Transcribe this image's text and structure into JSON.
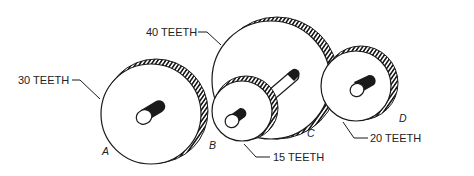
{
  "figure": {
    "type": "gear-train",
    "labels": {
      "gear_a_teeth": "30 TEETH",
      "gear_b_teeth": "15 TEETH",
      "gear_c_teeth": "40 TEETH",
      "gear_d_teeth": "20 TEETH"
    },
    "letters": {
      "a": "A",
      "b": "B",
      "c": "C",
      "d": "D"
    },
    "colors": {
      "line": "#1a1a1a",
      "background": "#ffffff"
    }
  }
}
